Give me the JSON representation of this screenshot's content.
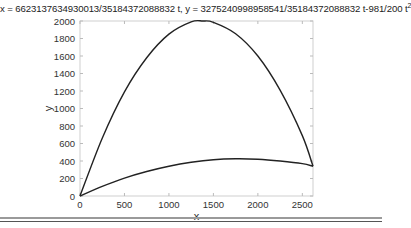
{
  "chart_data": {
    "type": "line",
    "title_main": "x = 6623137634930013/35184372088832 t, y = 3275240998958541/35184372088832 t-981/200 t",
    "title_sup": "2",
    "xlabel": "x",
    "ylabel": "y",
    "xlim": [
      0,
      2620
    ],
    "ylim": [
      0,
      2000
    ],
    "xticks": [
      0,
      500,
      1000,
      1500,
      2000,
      2500
    ],
    "yticks": [
      0,
      200,
      400,
      600,
      800,
      1000,
      1200,
      1400,
      1600,
      1800,
      2000
    ],
    "grid": false,
    "series": [
      {
        "name": "upper trajectory",
        "x": [
          0,
          250,
          500,
          750,
          1000,
          1250,
          1380,
          1500,
          1750,
          2000,
          2250,
          2500,
          2620
        ],
        "y": [
          0,
          660,
          1190,
          1580,
          1850,
          1990,
          2000,
          1985,
          1855,
          1600,
          1210,
          690,
          340
        ]
      },
      {
        "name": "lower trajectory",
        "x": [
          0,
          250,
          500,
          750,
          1000,
          1250,
          1500,
          1750,
          2000,
          2250,
          2500,
          2620
        ],
        "y": [
          0,
          110,
          205,
          280,
          340,
          385,
          415,
          425,
          420,
          400,
          370,
          340
        ]
      }
    ]
  }
}
